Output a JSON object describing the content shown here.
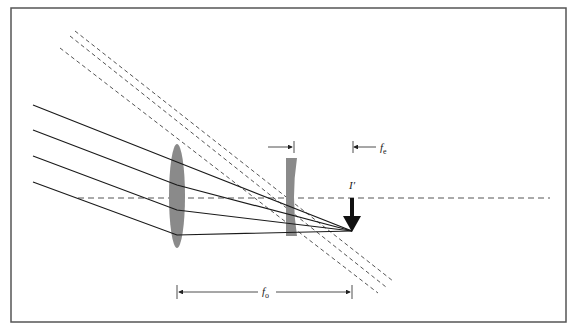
{
  "figure": {
    "type": "optical-ray-diagram",
    "colors": {
      "frame": "#555555",
      "ray_solid": "#1a1a1a",
      "ray_dashed": "#555555",
      "lens_fill": "#8a8a8a",
      "image_arrow": "#111111",
      "background": "#ffffff"
    },
    "labels": {
      "image": "I′",
      "eyepiece_focal": {
        "main": "f",
        "sub": "e"
      },
      "objective_focal": {
        "main": "f",
        "sub": "o"
      }
    },
    "elements": {
      "objective_lens": "converging (convex) lens",
      "eyepiece_lens": "diverging (concave) lens",
      "incoming_solid_rays": 4,
      "outgoing_dashed_rays": 3,
      "optical_axis": "dashed horizontal line"
    }
  }
}
